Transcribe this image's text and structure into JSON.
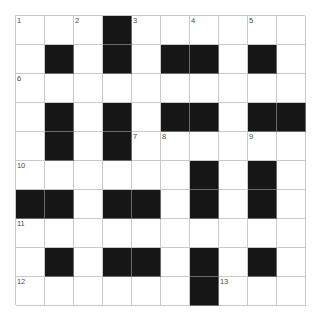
{
  "puzzle": {
    "title": "",
    "type": "crossword-grid",
    "rows": 10,
    "cols": 10,
    "cell_size_px": 29,
    "colors": {
      "background": "#ffffff",
      "block": "#161616",
      "grid_line": "#c9c9c9",
      "number_text": "#4a4a4a"
    },
    "legend": {
      "0": "open white cell",
      "1": "blocked black cell"
    },
    "blocks": [
      [
        0,
        0,
        0,
        1,
        0,
        0,
        0,
        0,
        0,
        0
      ],
      [
        0,
        1,
        0,
        1,
        0,
        1,
        1,
        0,
        1,
        0
      ],
      [
        0,
        0,
        0,
        0,
        0,
        0,
        0,
        0,
        0,
        0
      ],
      [
        0,
        1,
        0,
        1,
        0,
        1,
        1,
        0,
        1,
        1
      ],
      [
        0,
        1,
        0,
        1,
        0,
        0,
        0,
        0,
        0,
        0
      ],
      [
        0,
        0,
        0,
        0,
        0,
        0,
        1,
        0,
        1,
        0
      ],
      [
        1,
        1,
        0,
        1,
        1,
        0,
        1,
        0,
        1,
        0
      ],
      [
        0,
        0,
        0,
        0,
        0,
        0,
        0,
        0,
        0,
        0
      ],
      [
        0,
        1,
        0,
        1,
        1,
        0,
        1,
        0,
        1,
        0
      ],
      [
        0,
        0,
        0,
        0,
        0,
        0,
        1,
        0,
        0,
        0
      ]
    ],
    "numbers": [
      {
        "label": "1",
        "row": 0,
        "col": 0
      },
      {
        "label": "2",
        "row": 0,
        "col": 2
      },
      {
        "label": "3",
        "row": 0,
        "col": 4
      },
      {
        "label": "4",
        "row": 0,
        "col": 6
      },
      {
        "label": "5",
        "row": 0,
        "col": 8
      },
      {
        "label": "6",
        "row": 2,
        "col": 0
      },
      {
        "label": "7",
        "row": 4,
        "col": 4
      },
      {
        "label": "8",
        "row": 4,
        "col": 5
      },
      {
        "label": "9",
        "row": 4,
        "col": 8
      },
      {
        "label": "10",
        "row": 5,
        "col": 0
      },
      {
        "label": "11",
        "row": 7,
        "col": 0
      },
      {
        "label": "12",
        "row": 9,
        "col": 0
      },
      {
        "label": "13",
        "row": 9,
        "col": 7
      }
    ]
  }
}
